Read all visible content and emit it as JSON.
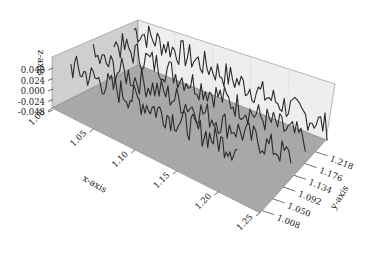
{
  "chart_data": {
    "type": "line",
    "subtype": "3d-line-waterfall",
    "title": "",
    "xlabel": "x-axis",
    "ylabel": "y-axis",
    "zlabel": "z-axis",
    "x_ticks": [
      "1.00",
      "1.05",
      "1.10",
      "1.15",
      "1.20",
      "1.25"
    ],
    "y_ticks": [
      "1.008",
      "1.050",
      "1.092",
      "1.134",
      "1.176",
      "1.218"
    ],
    "z_ticks": [
      "0.048",
      "0.024",
      "0.000",
      "-0.024",
      "-0.048"
    ],
    "xlim": [
      1.0,
      1.25
    ],
    "ylim": [
      1.008,
      1.26
    ],
    "zlim": [
      -0.048,
      0.06
    ],
    "grid": false,
    "legend": null,
    "series": [
      {
        "name": "trace-1",
        "y": 1.218,
        "x_range": [
          1.0,
          1.19
        ],
        "description": "back trace, noisy around z≈0.03"
      },
      {
        "name": "trace-2",
        "y": 1.176,
        "x_range": [
          1.0,
          1.2
        ],
        "description": "noisy trace"
      },
      {
        "name": "trace-3",
        "y": 1.134,
        "x_range": [
          1.0,
          1.21
        ],
        "description": "noisy trace"
      },
      {
        "name": "trace-4",
        "y": 1.092,
        "x_range": [
          1.0,
          1.18
        ],
        "description": "front-most trace, noisy"
      }
    ],
    "colors": {
      "line": "#2a2a2a",
      "floor": "#a9a9a9",
      "left_wall": "#d0d0d0",
      "back_wall": "#ececec"
    }
  }
}
